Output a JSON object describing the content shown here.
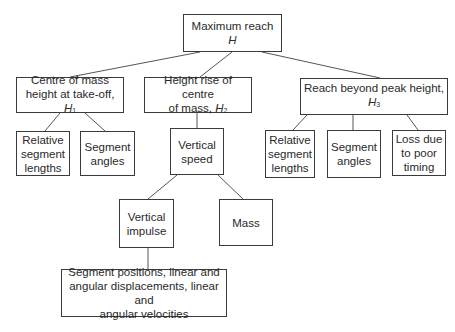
{
  "diagram": {
    "type": "tree",
    "colors": {
      "line": "#555555",
      "border": "#3a3a3a",
      "text": "#2a2a2a",
      "background": "#ffffff"
    },
    "nodes": {
      "root": {
        "line1": "Maximum reach",
        "var": "H",
        "sub": ""
      },
      "h1": {
        "line1": "Centre of mass",
        "line2": "height at take-off, ",
        "var": "H",
        "sub": "1"
      },
      "h2": {
        "line1": "Height rise of centre",
        "line2": "of mass, ",
        "var": "H",
        "sub": "2"
      },
      "h3": {
        "line1": "Reach beyond peak height,",
        "var": "H",
        "sub": "3"
      },
      "h1_rel": {
        "lines": [
          "Relative",
          "segment",
          "lengths"
        ]
      },
      "h1_ang": {
        "lines": [
          "Segment",
          "angles"
        ]
      },
      "vspeed": {
        "lines": [
          "Vertical",
          "speed"
        ]
      },
      "h3_rel": {
        "lines": [
          "Relative",
          "segment",
          "lengths"
        ]
      },
      "h3_ang": {
        "lines": [
          "Segment",
          "angles"
        ]
      },
      "h3_loss": {
        "lines": [
          "Loss due",
          "to poor",
          "timing"
        ]
      },
      "vimpulse": {
        "lines": [
          "Vertical",
          "impulse"
        ]
      },
      "mass": {
        "lines": [
          "Mass"
        ]
      },
      "bottom": {
        "lines": [
          "Segment positions, linear and",
          "angular displacements, linear and",
          "angular velocities"
        ]
      }
    },
    "edges": [
      [
        "root",
        "h1"
      ],
      [
        "root",
        "h2"
      ],
      [
        "root",
        "h3"
      ],
      [
        "h1",
        "h1_rel"
      ],
      [
        "h1",
        "h1_ang"
      ],
      [
        "h2",
        "vspeed"
      ],
      [
        "h3",
        "h3_rel"
      ],
      [
        "h3",
        "h3_ang"
      ],
      [
        "h3",
        "h3_loss"
      ],
      [
        "vspeed",
        "vimpulse"
      ],
      [
        "vspeed",
        "mass"
      ],
      [
        "vimpulse",
        "bottom"
      ]
    ]
  }
}
